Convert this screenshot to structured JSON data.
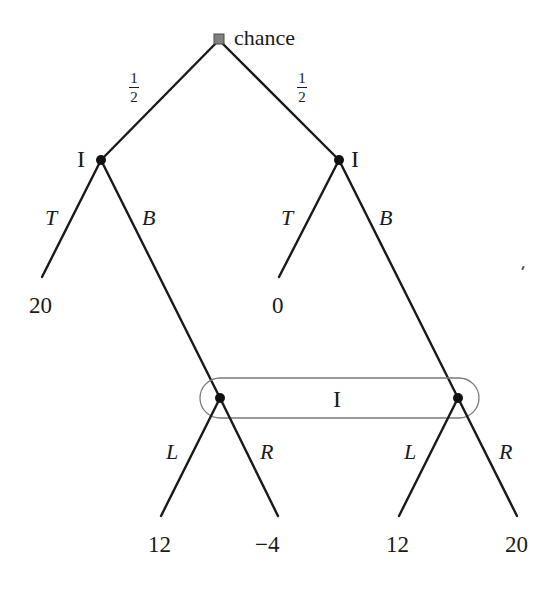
{
  "diagram": {
    "type": "extensive-form game tree",
    "root": {
      "label": "chance",
      "kind": "chance-node"
    },
    "chance_branches": [
      {
        "prob_num": "1",
        "prob_den": "2",
        "side": "left"
      },
      {
        "prob_num": "1",
        "prob_den": "2",
        "side": "right"
      }
    ],
    "decision_nodes": [
      {
        "id": "left",
        "player": "I"
      },
      {
        "id": "right",
        "player": "I"
      }
    ],
    "first_actions": {
      "left": [
        {
          "label": "T",
          "payoff": "20"
        },
        {
          "label": "B"
        }
      ],
      "right": [
        {
          "label": "T",
          "payoff": "0"
        },
        {
          "label": "B"
        }
      ]
    },
    "information_set": {
      "player": "I",
      "nodes": 2
    },
    "second_actions": {
      "left": [
        {
          "label": "L",
          "payoff": "12"
        },
        {
          "label": "R",
          "payoff": "−4"
        }
      ],
      "right": [
        {
          "label": "L",
          "payoff": "12"
        },
        {
          "label": "R",
          "payoff": "20"
        }
      ]
    }
  },
  "colors": {
    "edge": "#1a1a1a",
    "node": "#111111",
    "chance_fill": "#808080",
    "info_set_outline": "#7a7a7a"
  }
}
